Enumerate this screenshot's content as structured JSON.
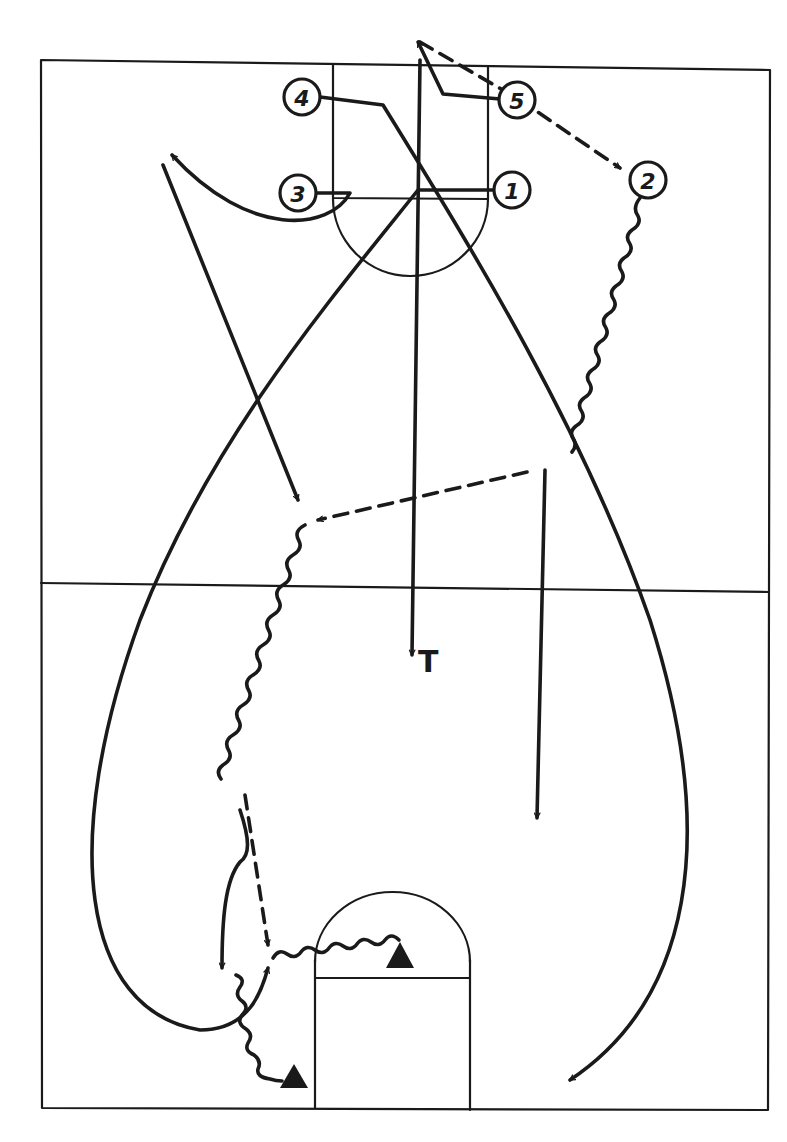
{
  "diagram": {
    "type": "basketball-play",
    "court": {
      "outline": {
        "x1": 40,
        "y1": 60,
        "x2": 770,
        "y2": 1110
      },
      "half_court_line_y": 590,
      "stroke_color": "#1a1a1a"
    },
    "players": [
      {
        "id": "player-1",
        "label": "1",
        "x": 512,
        "y": 190
      },
      {
        "id": "player-2",
        "label": "2",
        "x": 648,
        "y": 180
      },
      {
        "id": "player-3",
        "label": "3",
        "x": 298,
        "y": 193
      },
      {
        "id": "player-4",
        "label": "4",
        "x": 302,
        "y": 97
      },
      {
        "id": "player-5",
        "label": "5",
        "x": 517,
        "y": 100
      }
    ],
    "annotations": [
      {
        "id": "trailer-label",
        "text": "T",
        "x": 418,
        "y": 672
      }
    ],
    "cones": [
      {
        "id": "cone-lane",
        "x": 400,
        "y": 956
      },
      {
        "id": "cone-baseline",
        "x": 294,
        "y": 1078
      }
    ],
    "legend": {
      "solid_line": "player cut",
      "dashed_line": "pass",
      "wavy_line": "dribble",
      "triangle": "cone"
    }
  }
}
